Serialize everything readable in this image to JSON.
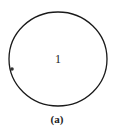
{
  "diagram": {
    "shape": "circle",
    "region_label": "1",
    "caption": "(a)",
    "stroke_color": "#1a1a1a",
    "marker": "dot-on-left-edge"
  }
}
